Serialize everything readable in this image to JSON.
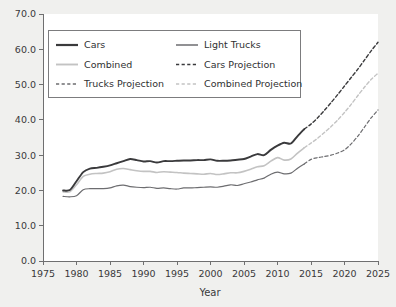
{
  "chart_data": {
    "type": "line",
    "title": "",
    "xlabel": "Year",
    "ylabel": "",
    "xlim": [
      1975,
      2025
    ],
    "ylim": [
      0.0,
      70.0
    ],
    "grid": false,
    "legend_position": "upper-left",
    "xticks": [
      "1975",
      "1980",
      "1985",
      "1990",
      "1995",
      "2000",
      "2005",
      "2010",
      "2015",
      "2020",
      "2025"
    ],
    "xtick_values": [
      1975,
      1980,
      1985,
      1990,
      1995,
      2000,
      2005,
      2010,
      2015,
      2020,
      2025
    ],
    "yticks": [
      "0.0",
      "10.0",
      "20.0",
      "30.0",
      "40.0",
      "50.0",
      "60.0",
      "70.0"
    ],
    "ytick_values": [
      0,
      10,
      20,
      30,
      40,
      50,
      60,
      70
    ],
    "series": [
      {
        "name": "Cars",
        "style": "solid",
        "color": "#3a3a3c",
        "width": 1.9,
        "x": [
          1978,
          1979,
          1980,
          1981,
          1982,
          1983,
          1984,
          1985,
          1986,
          1987,
          1988,
          1989,
          1990,
          1991,
          1992,
          1993,
          1994,
          1995,
          1996,
          1997,
          1998,
          1999,
          2000,
          2001,
          2002,
          2003,
          2004,
          2005,
          2006,
          2007,
          2008,
          2009,
          2010,
          2011,
          2012,
          2013,
          2014
        ],
        "values": [
          20.0,
          20.1,
          22.6,
          25.2,
          26.2,
          26.4,
          26.7,
          27.1,
          27.7,
          28.3,
          28.9,
          28.6,
          28.2,
          28.3,
          27.9,
          28.3,
          28.3,
          28.4,
          28.5,
          28.5,
          28.6,
          28.6,
          28.8,
          28.4,
          28.4,
          28.5,
          28.7,
          28.9,
          29.6,
          30.3,
          30.0,
          31.5,
          32.7,
          33.5,
          33.3,
          35.4,
          37.4
        ]
      },
      {
        "name": "Light Trucks",
        "style": "solid",
        "color": "#6d6d70",
        "width": 1.2,
        "x": [
          1978,
          1979,
          1980,
          1981,
          1982,
          1983,
          1984,
          1985,
          1986,
          1987,
          1988,
          1989,
          1990,
          1991,
          1992,
          1993,
          1994,
          1995,
          1996,
          1997,
          1998,
          1999,
          2000,
          2001,
          2002,
          2003,
          2004,
          2005,
          2006,
          2007,
          2008,
          2009,
          2010,
          2011,
          2012,
          2013,
          2014
        ],
        "values": [
          18.3,
          18.2,
          18.5,
          20.2,
          20.5,
          20.5,
          20.5,
          20.7,
          21.3,
          21.5,
          21.1,
          20.9,
          20.8,
          20.9,
          20.6,
          20.7,
          20.5,
          20.4,
          20.7,
          20.7,
          20.8,
          20.9,
          21.0,
          20.9,
          21.2,
          21.6,
          21.4,
          21.9,
          22.4,
          23.0,
          23.5,
          24.6,
          25.2,
          24.7,
          24.9,
          26.3,
          27.5
        ]
      },
      {
        "name": "Combined",
        "style": "solid",
        "color": "#c3c3c3",
        "width": 1.6,
        "x": [
          1978,
          1979,
          1980,
          1981,
          1982,
          1983,
          1984,
          1985,
          1986,
          1987,
          1988,
          1989,
          1990,
          1991,
          1992,
          1993,
          1994,
          1995,
          1996,
          1997,
          1998,
          1999,
          2000,
          2001,
          2002,
          2003,
          2004,
          2005,
          2006,
          2007,
          2008,
          2009,
          2010,
          2011,
          2012,
          2013,
          2014
        ],
        "values": [
          19.6,
          19.6,
          21.6,
          24.0,
          24.6,
          24.8,
          24.9,
          25.3,
          26.0,
          26.2,
          25.9,
          25.6,
          25.4,
          25.4,
          25.1,
          25.3,
          25.2,
          25.1,
          24.9,
          24.8,
          24.7,
          24.6,
          24.8,
          24.5,
          24.7,
          25.0,
          25.0,
          25.4,
          26.0,
          26.7,
          27.0,
          28.3,
          29.3,
          28.6,
          28.9,
          30.6,
          32.1
        ]
      },
      {
        "name": "Cars Projection",
        "style": "dashed",
        "color": "#3a3a3c",
        "width": 1.4,
        "x": [
          2014,
          2015,
          2016,
          2017,
          2018,
          2019,
          2020,
          2021,
          2022,
          2023,
          2024,
          2025
        ],
        "values": [
          37.4,
          38.8,
          40.6,
          42.7,
          44.9,
          47.2,
          49.6,
          52.0,
          54.4,
          57.0,
          59.6,
          62.0
        ]
      },
      {
        "name": "Trucks Projection",
        "style": "dashed",
        "color": "#6d6d70",
        "width": 1.2,
        "x": [
          2014,
          2015,
          2016,
          2017,
          2018,
          2019,
          2020,
          2021,
          2022,
          2023,
          2024,
          2025
        ],
        "values": [
          27.5,
          28.8,
          29.3,
          29.6,
          30.0,
          30.6,
          31.5,
          33.2,
          35.4,
          38.0,
          40.6,
          42.8
        ]
      },
      {
        "name": "Combined Projection",
        "style": "dashed",
        "color": "#c3c3c3",
        "width": 1.4,
        "x": [
          2014,
          2015,
          2016,
          2017,
          2018,
          2019,
          2020,
          2021,
          2022,
          2023,
          2024,
          2025
        ],
        "values": [
          32.1,
          33.4,
          34.8,
          36.4,
          38.1,
          40.0,
          42.1,
          44.4,
          46.9,
          49.3,
          51.5,
          53.2
        ]
      }
    ]
  },
  "legend": {
    "entries": [
      {
        "label": "Cars",
        "key": "Cars"
      },
      {
        "label": "Light Trucks",
        "key": "Light Trucks"
      },
      {
        "label": "Combined",
        "key": "Combined"
      },
      {
        "label": "Cars Projection",
        "key": "Cars Projection"
      },
      {
        "label": "Trucks Projection",
        "key": "Trucks Projection"
      },
      {
        "label": "Combined Projection",
        "key": "Combined Projection"
      }
    ]
  },
  "colors": {
    "page_background": "#f0f0ee",
    "plot_background": "#ffffff",
    "axis": "#6f6f70",
    "text": "#39393b",
    "cars": "#3a3a3c",
    "light_trucks": "#6d6d70",
    "combined": "#c3c3c3"
  }
}
